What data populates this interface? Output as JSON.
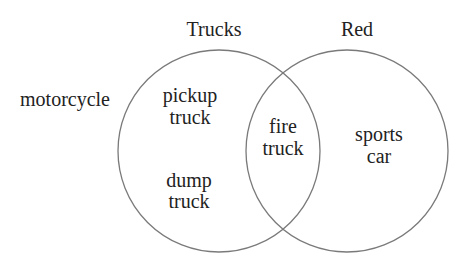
{
  "diagram": {
    "type": "venn",
    "stroke_color": "#7a7a7a",
    "text_color": "#222222",
    "sets": [
      {
        "name": "Trucks",
        "label": "Trucks"
      },
      {
        "name": "Red",
        "label": "Red"
      }
    ],
    "outside": {
      "label": "motorcycle"
    },
    "trucks_only": [
      {
        "line1": "pickup",
        "line2": "truck"
      },
      {
        "line1": "dump",
        "line2": "truck"
      }
    ],
    "intersection": {
      "line1": "fire",
      "line2": "truck"
    },
    "red_only": {
      "line1": "sports",
      "line2": "car"
    }
  }
}
